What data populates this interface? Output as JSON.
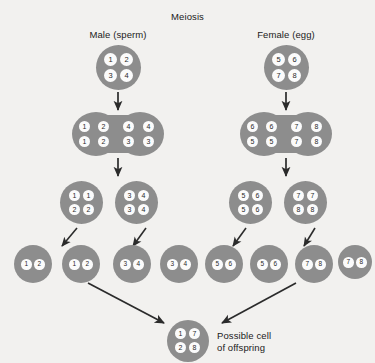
{
  "title": "Meiosis",
  "columns": {
    "male_label": "Male (sperm)",
    "female_label": "Female (egg)"
  },
  "offspring": {
    "caption_line1": "Possible cell",
    "caption_line2": "of offspring",
    "chromosomes": [
      "1",
      "7",
      "2",
      "8"
    ]
  },
  "colors": {
    "background": "#f2f1ef",
    "cell_fill": "#8d8d8d",
    "chromosome_fill": "#fbfbfb",
    "text": "#1a1a1a",
    "arrow": "#2b2b2b"
  },
  "rows": {
    "parent": {
      "male": [
        "1",
        "2",
        "3",
        "4"
      ],
      "female": [
        "5",
        "6",
        "7",
        "8"
      ]
    },
    "duplicated": {
      "male_top": [
        "1",
        "2",
        "4",
        "4"
      ],
      "male_bottom": [
        "1",
        "2",
        "3",
        "3"
      ],
      "female_top": [
        "6",
        "6",
        "7",
        "8"
      ],
      "female_bottom": [
        "5",
        "5",
        "7",
        "8"
      ]
    },
    "division1": {
      "male_a": [
        "1",
        "1",
        "2",
        "2"
      ],
      "male_b": [
        "3",
        "4",
        "3",
        "4"
      ],
      "female_a": [
        "5",
        "6",
        "5",
        "6"
      ],
      "female_b": [
        "7",
        "7",
        "8",
        "8"
      ]
    },
    "gametes": {
      "male": [
        [
          "1",
          "2"
        ],
        [
          "1",
          "2"
        ],
        [
          "3",
          "4"
        ],
        [
          "3",
          "4"
        ]
      ],
      "female": [
        [
          "5",
          "6"
        ],
        [
          "5",
          "6"
        ],
        [
          "7",
          "8"
        ],
        [
          "7",
          "8"
        ]
      ]
    }
  }
}
